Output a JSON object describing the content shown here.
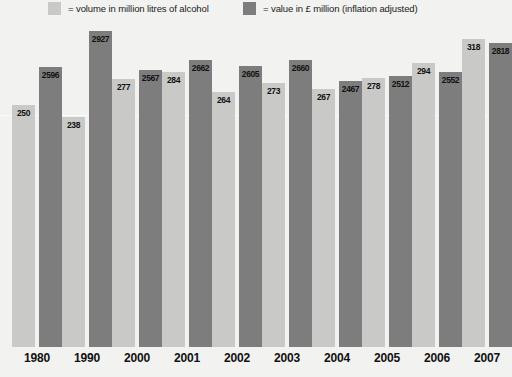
{
  "legend": {
    "volume": {
      "label": "= volume in million litres of alcohol",
      "color": "#c9c9c7",
      "swatch_name": "legend-swatch-volume"
    },
    "value": {
      "label": "= value in £ million (inflation adjusted)",
      "color": "#7d7d7d",
      "swatch_name": "legend-swatch-value"
    }
  },
  "chart_data": {
    "type": "bar",
    "title": "",
    "xlabel": "",
    "ylabel": "",
    "grid": true,
    "legend_position": "top",
    "categories": [
      "1980",
      "1990",
      "2000",
      "2001",
      "2002",
      "2003",
      "2004",
      "2005",
      "2006",
      "2007"
    ],
    "series": [
      {
        "name": "volume in million litres of alcohol",
        "color": "#c9c9c7",
        "axis": "volume",
        "ylim": [
          0,
          340
        ],
        "values": [
          250,
          238,
          277,
          284,
          264,
          273,
          267,
          278,
          294,
          318
        ]
      },
      {
        "name": "value in £ million (inflation adjusted)",
        "color": "#7d7d7d",
        "axis": "value",
        "ylim": [
          0,
          3050
        ],
        "values": [
          2596,
          2927,
          2567,
          2662,
          2605,
          2660,
          2467,
          2512,
          2552,
          2818
        ]
      }
    ]
  },
  "colors": {
    "background": "#f2f2f0",
    "volume_bar": "#c9c9c7",
    "value_bar": "#7d7d7d",
    "text": "#111111",
    "gridline": "#fdfdfd"
  }
}
